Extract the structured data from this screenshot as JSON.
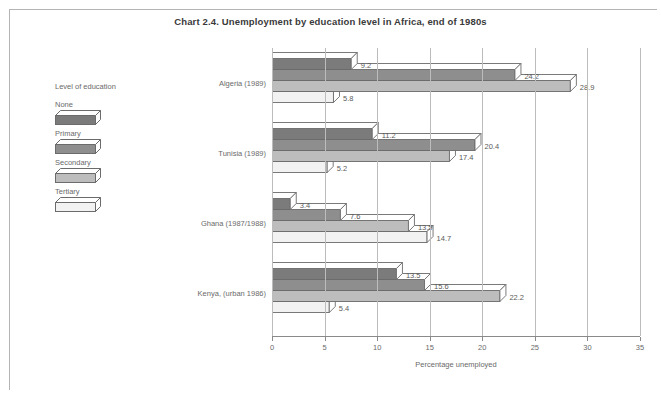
{
  "chart_data": {
    "type": "bar",
    "orientation": "horizontal",
    "style": "3d-grouped",
    "title": "Chart 2.4.  Unemployment by education level in Africa, end of 1980s",
    "xlabel": "Percentage unemployed",
    "ylabel": "",
    "xlim": [
      0,
      35
    ],
    "xticks": [
      0,
      5,
      10,
      15,
      20,
      25,
      30,
      35
    ],
    "grid": "vertical",
    "legend_title": "Level of education",
    "legend_position": "left-outside",
    "categories": [
      "Algeria (1989)",
      "Tunisia (1989)",
      "Ghana (1987/1988)",
      "Kenya,  (urban 1986)"
    ],
    "series": [
      {
        "name": "None",
        "color": "#7b7b7b",
        "values": [
          9.2,
          11.2,
          3.4,
          13.5
        ]
      },
      {
        "name": "Primary",
        "color": "#8e8e8e",
        "values": [
          24.2,
          20.4,
          7.6,
          15.6
        ]
      },
      {
        "name": "Secondary",
        "color": "#bdbdbd",
        "values": [
          28.9,
          17.4,
          13.5,
          22.2
        ]
      },
      {
        "name": "Tertiary",
        "color": "#f2f2f2",
        "values": [
          5.8,
          5.2,
          14.7,
          5.4
        ]
      }
    ],
    "value_labels": [
      [
        "9.2",
        "24.2",
        "28.9",
        "5.8"
      ],
      [
        "11.2",
        "20.4",
        "17.4",
        "5.2"
      ],
      [
        "3.4",
        "7.6",
        "13.5",
        "14.7"
      ],
      [
        "13.5",
        "15.6",
        "22.2",
        "5.4"
      ]
    ],
    "tick_labels": [
      "0",
      "5",
      "10",
      "15",
      "20",
      "25",
      "30",
      "35"
    ]
  },
  "colors": {
    "frame": "#b4b4b4",
    "axis": "#8a8a8a",
    "grid": "#bcbcbc",
    "text": "#6a6a6a",
    "title": "#3a3a3a",
    "bar_outline": "#6b6b6b"
  }
}
